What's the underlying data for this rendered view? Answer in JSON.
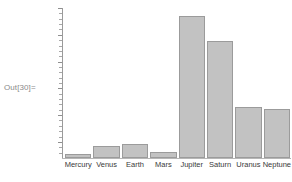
{
  "cell": {
    "out_label": "Out[30]="
  },
  "style": {
    "bar_fill": "#c2c2c2",
    "bar_border": "#9b9b9b",
    "axis_color": "#9a9a9a",
    "baseline_color": "#b6b6b6",
    "label_color": "#3a3a3a",
    "prompt_color": "#8a8a8a",
    "background": "#ffffff"
  },
  "chart_data": {
    "type": "bar",
    "title": "",
    "xlabel": "",
    "ylabel": "",
    "grid": false,
    "legend": null,
    "ylim": [
      0,
      75000
    ],
    "categories": [
      "Mercury",
      "Venus",
      "Earth",
      "Mars",
      "Jupiter",
      "Saturn",
      "Uranus",
      "Neptune"
    ],
    "values": [
      2440,
      6052,
      6371,
      3390,
      69911,
      58232,
      25362,
      24622
    ],
    "bar_pixel_tops": [
      154,
      146,
      144,
      152,
      16,
      41,
      107,
      109
    ],
    "bar_pixel_baseline": 158,
    "axis_tick_count": 28,
    "axis_major_tick_every": 5
  }
}
